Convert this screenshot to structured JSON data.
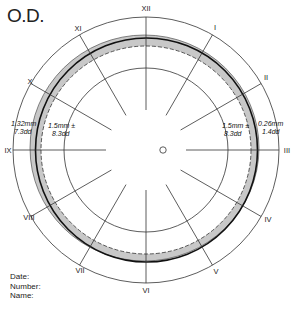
{
  "title": "O.D.",
  "clock_labels": [
    {
      "label": "XII",
      "x": 146,
      "y": 11
    },
    {
      "label": "I",
      "x": 213,
      "y": 30
    },
    {
      "label": "II",
      "x": 266,
      "y": 80
    },
    {
      "label": "III",
      "x": 287,
      "y": 153
    },
    {
      "label": "IV",
      "x": 268,
      "y": 220
    },
    {
      "label": "V",
      "x": 215,
      "y": 273
    },
    {
      "label": "VI",
      "x": 146,
      "y": 292
    },
    {
      "label": "VII",
      "x": 80,
      "y": 271
    },
    {
      "label": "VIII",
      "x": 31,
      "y": 220
    },
    {
      "label": "IX",
      "x": 7,
      "y": 153
    },
    {
      "label": "X",
      "x": 29,
      "y": 86
    },
    {
      "label": "XI",
      "x": 78,
      "y": 30
    }
  ],
  "measurements": {
    "left_outer": {
      "line1": "1.32mm",
      "line2": "7.3dd"
    },
    "left_inner": {
      "line1": "1.5mm ±",
      "line2": "8.3dd"
    },
    "right_inner": {
      "line1": "1.5mm ±",
      "line2": "8.3dd"
    },
    "right_outer": {
      "line1": "0.26mm",
      "line2": "1.4dd"
    }
  },
  "meta": {
    "date_label": "Date:",
    "number_label": "Number:",
    "name_label": "Name:"
  },
  "colors": {
    "band_fill": "#c8c8c8",
    "line": "#222222"
  }
}
